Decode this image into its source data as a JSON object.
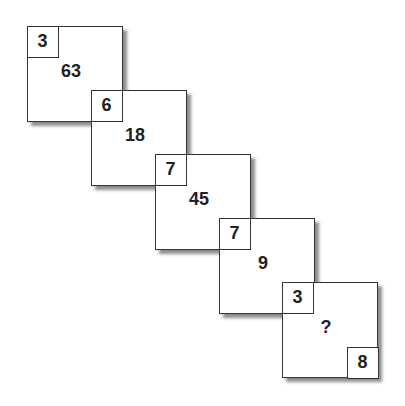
{
  "puzzle": {
    "squares": [
      {
        "corner": "3",
        "center": "63"
      },
      {
        "corner": "6",
        "center": "18"
      },
      {
        "corner": "7",
        "center": "45"
      },
      {
        "corner": "7",
        "center": "9"
      },
      {
        "corner": "3",
        "center": "?",
        "bottom_corner": "8"
      }
    ]
  }
}
